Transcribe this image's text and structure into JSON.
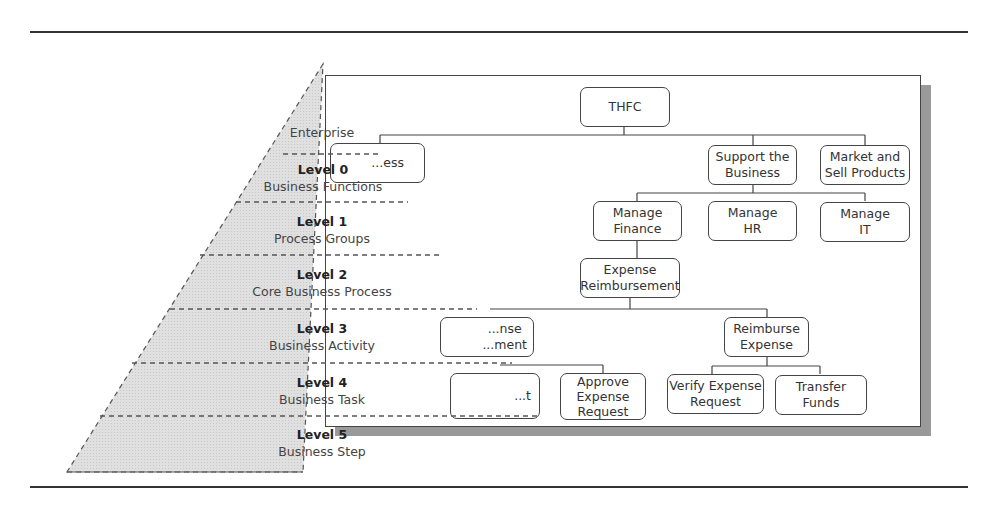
{
  "pyramid": {
    "apex_label": "Enterprise",
    "levels": [
      {
        "title": "Level 0",
        "subtitle": "Business Functions"
      },
      {
        "title": "Level 1",
        "subtitle": "Process Groups"
      },
      {
        "title": "Level 2",
        "subtitle": "Core Business Process"
      },
      {
        "title": "Level 3",
        "subtitle": "Business Activity"
      },
      {
        "title": "Level 4",
        "subtitle": "Business Task"
      },
      {
        "title": "Level 5",
        "subtitle": "Business Step"
      }
    ],
    "fill_color": "#dcdcdc"
  },
  "org_chart": {
    "root": "THFC",
    "level0": [
      "...ess",
      "Support the\nBusiness",
      "Market and\nSell Products"
    ],
    "level1": [
      "Manage\nFinance",
      "Manage\nHR",
      "Manage\nIT"
    ],
    "level2": [
      "Expense\nReimbursement"
    ],
    "level3": [
      "...nse\n...ment",
      "Reimburse\nExpense"
    ],
    "level4": [
      "...t",
      "Approve\nExpense\nRequest",
      "Verify Expense\nRequest",
      "Transfer Funds"
    ]
  }
}
